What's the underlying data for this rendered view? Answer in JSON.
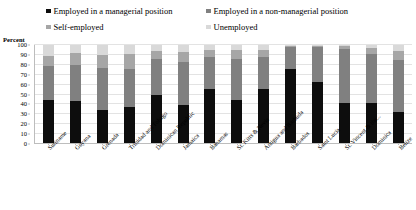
{
  "chart_data": {
    "type": "bar",
    "subtype": "stacked-bar-100-percent",
    "title": "",
    "xlabel": "",
    "ylabel": "Percent",
    "ylim": [
      0,
      100
    ],
    "ytick_step": 10,
    "yticks": [
      0,
      10,
      20,
      30,
      40,
      50,
      60,
      70,
      80,
      90,
      100
    ],
    "grid": true,
    "legend_position": "top",
    "categories": [
      "Suriname",
      "Guyana",
      "Grenada",
      "Trinidad and Tobago",
      "Dominican Republic",
      "Jamaica",
      "Bahamas",
      "St. Kitts & Nevis",
      "Antigua and Barbuda",
      "Barbados",
      "Saint Lucia",
      "St. Vincent & the...",
      "Dominica",
      "Belize"
    ],
    "series": [
      {
        "name": "Employed in a managerial position",
        "color": "#0d0d0d",
        "values": [
          44,
          43,
          34,
          37,
          49,
          39,
          55,
          44,
          55,
          76,
          62,
          41,
          41,
          32
        ]
      },
      {
        "name": "Employed in a non-managerial position",
        "color": "#808080",
        "values": [
          35,
          37,
          43,
          39,
          37,
          44,
          33,
          42,
          33,
          22,
          36,
          55,
          50,
          53
        ]
      },
      {
        "name": "Self-employed",
        "color": "#a6a6a6",
        "values": [
          10,
          12,
          13,
          15,
          8,
          10,
          7,
          9,
          7,
          1,
          1,
          3,
          6,
          9
        ]
      },
      {
        "name": "Unemployed",
        "color": "#d9d9d9",
        "values": [
          11,
          8,
          10,
          9,
          6,
          7,
          5,
          5,
          5,
          1,
          1,
          1,
          3,
          6
        ]
      }
    ]
  },
  "legend": {
    "items": [
      {
        "label": "Employed in a managerial position",
        "color": "#0d0d0d"
      },
      {
        "label": "Employed in a non-managerial position",
        "color": "#808080"
      },
      {
        "label": "Self-employed",
        "color": "#a6a6a6"
      },
      {
        "label": "Unemployed",
        "color": "#d9d9d9"
      }
    ]
  },
  "axis": {
    "percent_label": "Percent"
  }
}
